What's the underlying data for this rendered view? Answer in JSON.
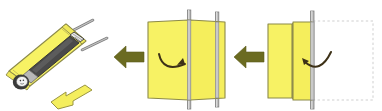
{
  "figure": {
    "reading_order": "right-to-left",
    "background_color": "#ffffff",
    "caption_top_right": "",
    "panel_count": 3
  },
  "colors": {
    "sheet_fill": "#f7f264",
    "sheet_fill_alt": "#f5ee5c",
    "sheet_stroke": "#8c8a49",
    "pole_fill": "#b9b9b9",
    "pole_stroke": "#7d7d7d",
    "step_arrow": "#6b6b21",
    "rotate_arrow": "#3d3117",
    "direction_arrow_fill": "#f4ee5e",
    "direction_arrow_stroke": "#9a9542",
    "ghost_dash": "#cfcfcf",
    "body_dark": "#4a4a4a",
    "body_mid": "#8d8d8d",
    "skin": "#f2f2f2",
    "hair": "#3a3a3a"
  },
  "panels": [
    {
      "id": "panel-3-start",
      "order_label": "3",
      "position": "right",
      "description": "Flat sheet with right half still unfolded; dashed ghost outline shows original extent",
      "sheet_segments": 2,
      "has_ghost_outline": true,
      "has_pole": true,
      "pole_count": 1,
      "rotation_arrow": "curved-arrow-left",
      "rotation_direction": "left"
    },
    {
      "id": "panel-2-middle",
      "order_label": "2",
      "position": "center",
      "description": "Sheet folded around two carrying poles, halves meeting at the center seam",
      "sheet_segments": 2,
      "has_ghost_outline": false,
      "has_pole": true,
      "pole_count": 2,
      "rotation_arrow": "curved-arrow-right",
      "rotation_direction": "right"
    },
    {
      "id": "panel-1-final",
      "order_label": "1",
      "position": "left",
      "description": "Completed stretcher carrying a person, shown in three-quarter perspective with carry handles",
      "sheet_segments": 1,
      "has_ghost_outline": false,
      "has_pole": true,
      "pole_count": 2,
      "rotation_arrow": "none",
      "rotation_direction": "none",
      "contains_person": true,
      "direction_arrow": "yellow-arrow-up-right"
    }
  ],
  "step_arrows": [
    {
      "id": "step-arrow-right",
      "direction": "left",
      "between": "panel-3-to-panel-2"
    },
    {
      "id": "step-arrow-left",
      "direction": "left",
      "between": "panel-2-to-panel-1"
    }
  ],
  "icons": {
    "step_arrow": "arrow-left-icon",
    "rotate_cw": "curved-arrow-right-icon",
    "rotate_ccw": "curved-arrow-left-icon",
    "direction": "arrow-up-right-icon",
    "person": "person-lying-icon",
    "pole": "pole-icon",
    "ghost": "dashed-outline-icon"
  }
}
